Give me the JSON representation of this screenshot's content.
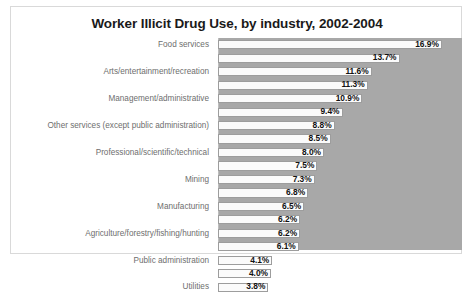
{
  "chart_data": {
    "type": "bar",
    "orientation": "horizontal",
    "title": "Worker Illicit Drug Use, by industry, 2002-2004",
    "xlabel": "",
    "ylabel": "",
    "xlim": [
      0,
      18
    ],
    "grid": false,
    "legend": "none",
    "value_suffix": "%",
    "categories": [
      "Food services",
      "",
      "Arts/entertainment/recreation",
      "",
      "Management/administrative",
      "",
      "Other services (except public administration)",
      "",
      "Professional/scientific/technical",
      "",
      "Mining",
      "",
      "Manufacturing",
      "",
      "Agriculture/forestry/fishing/hunting",
      "",
      "Public administration",
      "",
      "Utilities"
    ],
    "values": [
      16.9,
      13.7,
      11.6,
      11.3,
      10.9,
      9.4,
      8.8,
      8.5,
      8.0,
      7.5,
      7.3,
      6.8,
      6.5,
      6.2,
      6.2,
      6.1,
      4.1,
      4.0,
      3.8
    ],
    "value_labels": [
      "16.9%",
      "13.7%",
      "11.6%",
      "11.3%",
      "10.9%",
      "9.4%",
      "8.8%",
      "8.5%",
      "8.0%",
      "7.5%",
      "7.3%",
      "6.8%",
      "6.5%",
      "6.2%",
      "6.2%",
      "6.1%",
      "4.1%",
      "4.0%",
      "3.8%"
    ],
    "bars": [
      {
        "label": "Food services",
        "value": 16.9,
        "value_label": "16.9%"
      },
      {
        "label": "",
        "value": 13.7,
        "value_label": "13.7%"
      },
      {
        "label": "Arts/entertainment/recreation",
        "value": 11.6,
        "value_label": "11.6%"
      },
      {
        "label": "",
        "value": 11.3,
        "value_label": "11.3%"
      },
      {
        "label": "Management/administrative",
        "value": 10.9,
        "value_label": "10.9%"
      },
      {
        "label": "",
        "value": 9.4,
        "value_label": "9.4%"
      },
      {
        "label": "Other services (except public administration)",
        "value": 8.8,
        "value_label": "8.8%"
      },
      {
        "label": "",
        "value": 8.5,
        "value_label": "8.5%"
      },
      {
        "label": "Professional/scientific/technical",
        "value": 8.0,
        "value_label": "8.0%"
      },
      {
        "label": "",
        "value": 7.5,
        "value_label": "7.5%"
      },
      {
        "label": "Mining",
        "value": 7.3,
        "value_label": "7.3%"
      },
      {
        "label": "",
        "value": 6.8,
        "value_label": "6.8%"
      },
      {
        "label": "Manufacturing",
        "value": 6.5,
        "value_label": "6.5%"
      },
      {
        "label": "",
        "value": 6.2,
        "value_label": "6.2%"
      },
      {
        "label": "Agriculture/forestry/fishing/hunting",
        "value": 6.2,
        "value_label": "6.2%"
      },
      {
        "label": "",
        "value": 6.1,
        "value_label": "6.1%"
      },
      {
        "label": "Public administration",
        "value": 4.1,
        "value_label": "4.1%"
      },
      {
        "label": "",
        "value": 4.0,
        "value_label": "4.0%"
      },
      {
        "label": "Utilities",
        "value": 3.8,
        "value_label": "3.8%"
      }
    ]
  },
  "colors": {
    "plot_background": "#a8a8a8",
    "bar_fill": "#fbfbfb",
    "bar_outline": "#9d9d9d",
    "title_text": "#1a1a1a",
    "category_text": "#6e6e6e",
    "value_text": "#111111",
    "frame_border": "#d9d9d9",
    "page_background": "#ffffff"
  }
}
